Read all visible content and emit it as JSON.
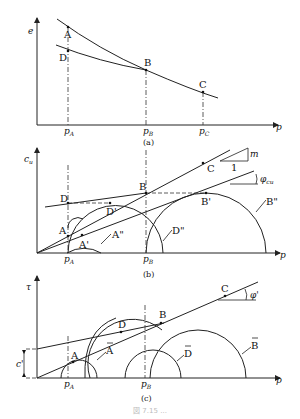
{
  "panels": {
    "a": {
      "caption": "(a)",
      "y_axis": "e",
      "x_axis": "p",
      "ticks": [
        {
          "main": "p",
          "sub": "A"
        },
        {
          "main": "p",
          "sub": "B"
        },
        {
          "main": "p",
          "sub": "C"
        }
      ],
      "points": [
        "A",
        "B",
        "C",
        "D"
      ]
    },
    "b": {
      "caption": "(b)",
      "y_axis": "c",
      "y_axis_sub": "u",
      "x_axis": "p",
      "ticks": [
        {
          "main": "p",
          "sub": "A"
        },
        {
          "main": "p",
          "sub": "B"
        }
      ],
      "points": [
        "A",
        "B",
        "C",
        "D",
        "A'",
        "B'",
        "D'",
        "A\"",
        "B\"",
        "D\""
      ],
      "slope_label_m": "m",
      "slope_label_1": "1",
      "angle_label": "φ",
      "angle_sub": "cu"
    },
    "c": {
      "caption": "(c)",
      "y_axis": "τ",
      "x_axis": "p",
      "ticks": [
        {
          "main": "p",
          "sub": "A"
        },
        {
          "main": "p",
          "sub": "B"
        }
      ],
      "points": [
        "A",
        "B",
        "C",
        "D"
      ],
      "circle_labels": [
        "A",
        "D",
        "B"
      ],
      "intercept_label": "c'",
      "angle_label": "φ'"
    }
  },
  "figure_caption": "図 7.15 ..."
}
